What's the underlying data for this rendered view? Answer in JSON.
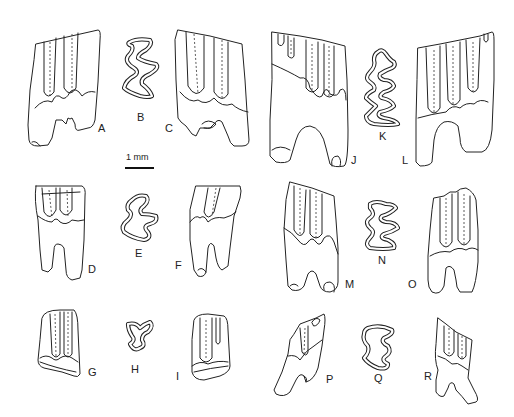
{
  "figure": {
    "type": "scientific-illustration",
    "scale_bar": {
      "label": "1 mm"
    },
    "panels": [
      {
        "id": "A",
        "label": "A",
        "view": "side"
      },
      {
        "id": "B",
        "label": "B",
        "view": "occlusal"
      },
      {
        "id": "C",
        "label": "C",
        "view": "side"
      },
      {
        "id": "D",
        "label": "D",
        "view": "side"
      },
      {
        "id": "E",
        "label": "E",
        "view": "occlusal"
      },
      {
        "id": "F",
        "label": "F",
        "view": "side"
      },
      {
        "id": "G",
        "label": "G",
        "view": "side"
      },
      {
        "id": "H",
        "label": "H",
        "view": "occlusal"
      },
      {
        "id": "I",
        "label": "I",
        "view": "side"
      },
      {
        "id": "J",
        "label": "J",
        "view": "side"
      },
      {
        "id": "K",
        "label": "K",
        "view": "occlusal"
      },
      {
        "id": "L",
        "label": "L",
        "view": "side"
      },
      {
        "id": "M",
        "label": "M",
        "view": "side"
      },
      {
        "id": "N",
        "label": "N",
        "view": "occlusal"
      },
      {
        "id": "O",
        "label": "O",
        "view": "side"
      },
      {
        "id": "P",
        "label": "P",
        "view": "side"
      },
      {
        "id": "Q",
        "label": "Q",
        "view": "occlusal"
      },
      {
        "id": "R",
        "label": "R",
        "view": "side"
      }
    ],
    "colors": {
      "line": "#222222",
      "background": "#ffffff"
    }
  }
}
